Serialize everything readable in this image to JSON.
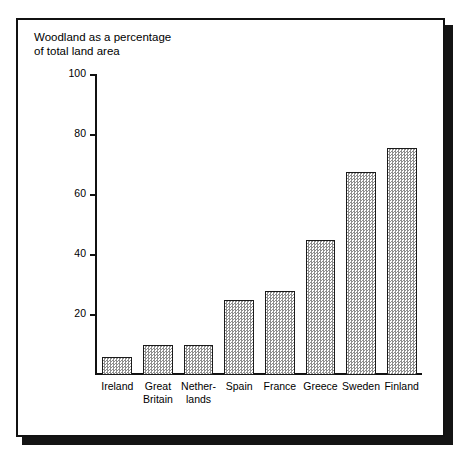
{
  "figure": {
    "title_line1": "Woodland as a percentage",
    "title_line2": "of total land area",
    "title": "Woodland as a percentage\nof total land area",
    "frame_color": "#111111",
    "shadow_color": "#141414",
    "bar_fill_color": "#8e8e8e",
    "bar_outline_color": "#1a1a1a"
  },
  "chart_data": {
    "type": "bar",
    "title": "Woodland as a percentage of total land area",
    "xlabel": "",
    "ylabel": "",
    "ylim": [
      0,
      100
    ],
    "yticks": [
      0,
      20,
      40,
      60,
      80,
      100
    ],
    "ytick_labels": [
      "",
      "20",
      "40",
      "60",
      "80",
      "100"
    ],
    "grid": false,
    "legend": false,
    "categories": [
      "Ireland",
      "Great\nBritain",
      "Nether-\nlands",
      "Spain",
      "France",
      "Greece",
      "Sweden",
      "Finland"
    ],
    "values": [
      6,
      10,
      10,
      25,
      28,
      45,
      68,
      76
    ],
    "units": "percent"
  }
}
